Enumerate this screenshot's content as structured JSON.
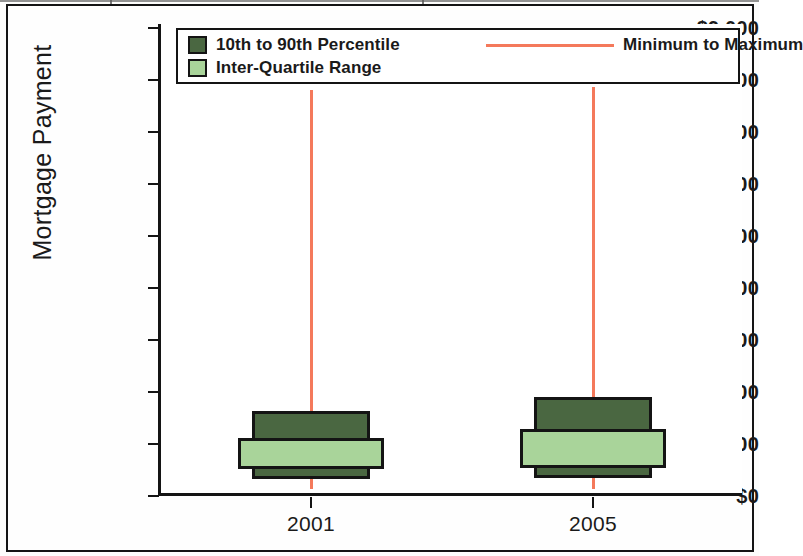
{
  "chart_data": {
    "type": "box",
    "title": "",
    "xlabel": "",
    "ylabel": "Mortgage Payment",
    "ylim": [
      0,
      9000
    ],
    "ytick_values": [
      0,
      1000,
      2000,
      3000,
      4000,
      5000,
      6000,
      7000,
      8000,
      9000
    ],
    "ytick_labels": [
      "$0",
      "$1,000",
      "$2,000",
      "$3,000",
      "$4,000",
      "$5,000",
      "$6,000",
      "$7,000",
      "$8,000",
      "$9,000"
    ],
    "categories": [
      "2001",
      "2005"
    ],
    "grid": false,
    "legend_position": "top-inside",
    "legend_entries": [
      {
        "label": "10th to 90th Percentile",
        "marker": "filled-square",
        "color": "#4a6741"
      },
      {
        "label": "Inter-Quartile Range",
        "marker": "filled-square",
        "color": "#a9d49a"
      },
      {
        "label": "Minimum to Maximum",
        "marker": "line",
        "color": "#f4795b"
      }
    ],
    "boxes": [
      {
        "category": "2001",
        "minimum": 130,
        "p10": 330,
        "q1": 520,
        "q3": 1110,
        "p90": 1630,
        "maximum": 7800
      },
      {
        "category": "2005",
        "minimum": 140,
        "p10": 340,
        "q1": 540,
        "q3": 1280,
        "p90": 1900,
        "maximum": 7870
      }
    ]
  },
  "axis": {
    "y_title": "Mortgage Payment"
  }
}
